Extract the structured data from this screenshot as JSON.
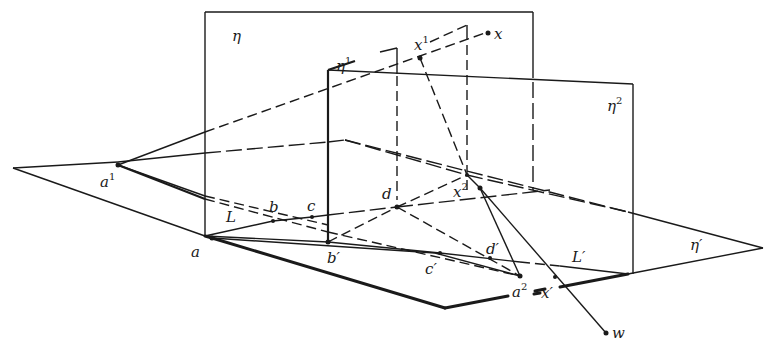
{
  "figure": {
    "planes": {
      "eta": "η",
      "eta1": "η",
      "eta1_sup": "1",
      "eta2": "η",
      "eta2_sup": "2",
      "eta_prime": "η′"
    },
    "points": {
      "a": "a",
      "a1": "a",
      "a1_sup": "1",
      "a2": "a",
      "a2_sup": "2",
      "b": "b",
      "b_prime": "b′",
      "c": "c",
      "c_prime": "c′",
      "d": "d",
      "d_prime": "d′",
      "x": "x",
      "x1": "x",
      "x1_sup": "1",
      "x2": "x",
      "x2_sup": "2",
      "x_prime": "x′",
      "w": "w"
    },
    "lines": {
      "L": "L",
      "L_prime": "L′"
    }
  }
}
